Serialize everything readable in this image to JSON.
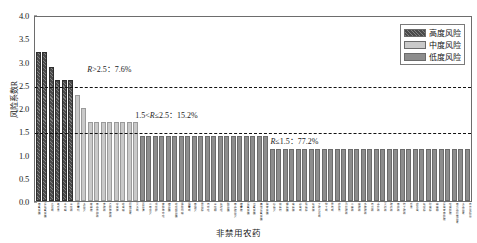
{
  "chart_data": {
    "type": "bar",
    "title": "",
    "xlabel": "非禁用农药",
    "ylabel": "风险系数R",
    "ylim": [
      0.0,
      4.0
    ],
    "ytick_labels": [
      "0.0",
      "0.5",
      "1.0",
      "1.5",
      "2.0",
      "2.5",
      "3.0",
      "3.5",
      "4.0"
    ],
    "ytick_values": [
      0.0,
      0.5,
      1.0,
      1.5,
      2.0,
      2.5,
      3.0,
      3.5,
      4.0
    ],
    "grid": false,
    "legend_position": "top-right",
    "reference_lines": [
      {
        "value": 2.5,
        "style": "dashed"
      },
      {
        "value": 1.5,
        "style": "dashed"
      }
    ],
    "series": [
      {
        "name": "高度风险",
        "color": "#4a4a4a",
        "hatch": "diagonal",
        "categories": [
          "甲氰菊酯",
          "氯氟氰菊酯",
          "克百威",
          "氧乐果",
          "毒死蜱",
          "三唑磷"
        ],
        "values": [
          3.24,
          3.24,
          2.92,
          2.62,
          2.62,
          2.62
        ]
      },
      {
        "name": "中度风险",
        "color": "#c9c9c9",
        "categories": [
          "腐霉利",
          "多菌灵",
          "咪鲜胺",
          "甲基异柳磷",
          "辛硫磷",
          "乙酰甲胺磷",
          "啶虫脒",
          "吡虫啉",
          "阿维菌素",
          "灭多威"
        ],
        "values": [
          2.31,
          2.03,
          1.72,
          1.72,
          1.72,
          1.72,
          1.72,
          1.72,
          1.72,
          1.72
        ]
      },
      {
        "name": "低度风险",
        "color": "#8d8d8d",
        "categories": [
          "百菌清",
          "二甲戊灵",
          "戊唑醇",
          "苯醚甲环唑",
          "嘧菌酯",
          "吡唑醚菌酯",
          "烯酰吗啉",
          "霜霉威",
          "甲霜灵",
          "异菌脲",
          "丙环唑",
          "三唑酮",
          "氟硅唑",
          "醚菌酯",
          "甲基硫菌灵",
          "嘧霉胺",
          "氯氰菊酯",
          "溴氰菊酯",
          "高效氯氰菊酯",
          "联苯菊酯",
          "哒螨灵",
          "炔螨特",
          "螺螨酯",
          "虫螨腈",
          "茚虫威",
          "虱螨脲",
          "氟虫腈",
          "丁硫克百威",
          "仲丁威",
          "异丙威",
          "敌敌畏",
          "马拉硫磷",
          "二嗪磷",
          "喹硫磷",
          "水胺硫磷",
          "丙溴磷",
          "杀扑磷",
          "灭线磷",
          "硫线磷",
          "甲拌磷",
          "特丁硫磷",
          "乐果",
          "敌百虫",
          "氟啶脲",
          "除虫脲",
          "噻嗪酮",
          "氯虫苯甲酰胺",
          "唑虫酰胺",
          "甲氨基阿维菌素",
          "多杀菌素",
          "苏云金杆菌"
        ],
        "values": [
          1.42,
          1.42,
          1.42,
          1.42,
          1.42,
          1.42,
          1.42,
          1.42,
          1.42,
          1.42,
          1.42,
          1.42,
          1.42,
          1.42,
          1.42,
          1.42,
          1.42,
          1.42,
          1.42,
          1.42,
          1.12,
          1.12,
          1.12,
          1.12,
          1.12,
          1.12,
          1.12,
          1.12,
          1.12,
          1.12,
          1.12,
          1.12,
          1.12,
          1.12,
          1.12,
          1.12,
          1.12,
          1.12,
          1.12,
          1.12,
          1.12,
          1.12,
          1.12,
          1.12,
          1.12,
          1.12,
          1.12,
          1.12,
          1.12,
          1.12,
          1.12
        ]
      }
    ],
    "annotations": [
      {
        "text_prefix": "R",
        "text": "R>2.5：7.6%",
        "at_x_pct": 12,
        "at_y": 3.02,
        "group": "高度风险",
        "share": "7.6%"
      },
      {
        "text_prefix": "R",
        "text": "1.5<R≤2.5：15.2%",
        "at_x_pct": 23,
        "at_y": 2.02,
        "group": "中度风险",
        "share": "15.2%"
      },
      {
        "text_prefix": "R",
        "text": "R≤1.5：77.2%",
        "at_x_pct": 54,
        "at_y": 1.47,
        "group": "低度风险",
        "share": "77.2%"
      }
    ]
  },
  "legend": {
    "items": [
      {
        "label": "高度风险",
        "swatch": "high"
      },
      {
        "label": "中度风险",
        "swatch": "mid"
      },
      {
        "label": "低度风险",
        "swatch": "low"
      }
    ]
  },
  "axes": {
    "y_title": "风险系数R",
    "x_title": "非禁用农药"
  },
  "annotation_text": {
    "high": "R>2.5：7.6%",
    "mid": "1.5<R≤2.5：15.2%",
    "low": "R≤1.5：77.2%"
  }
}
